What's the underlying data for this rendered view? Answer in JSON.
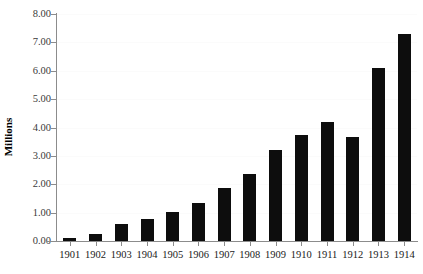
{
  "chart_data": {
    "type": "bar",
    "title": "",
    "subtitle": "",
    "xlabel": "",
    "ylabel": "Millions",
    "categories": [
      "1901",
      "1902",
      "1903",
      "1904",
      "1905",
      "1906",
      "1907",
      "1908",
      "1909",
      "1910",
      "1911",
      "1912",
      "1913",
      "1914"
    ],
    "values": [
      0.1,
      0.25,
      0.6,
      0.78,
      1.03,
      1.35,
      1.87,
      2.35,
      3.22,
      3.72,
      4.2,
      3.65,
      6.1,
      7.3
    ],
    "ylim": [
      0,
      8
    ],
    "y_ticks": [
      0,
      1,
      2,
      3,
      4,
      5,
      6,
      7,
      8
    ],
    "y_tick_labels": [
      "0.00",
      "1.00",
      "2.00",
      "3.00",
      "4.00",
      "5.00",
      "6.00",
      "7.00",
      "8.00"
    ],
    "grid": true,
    "legend": "none",
    "bar_color": "#0d0d0d",
    "axis_color": "#8c8c8c",
    "gridline_color": "#fbfbfb",
    "background_color": "#ffffff"
  }
}
